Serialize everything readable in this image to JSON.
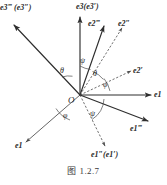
{
  "figure": {
    "caption": "图 1.2.7",
    "origin_label": "O"
  },
  "axes": [
    {
      "id": "e3",
      "label_html": "e3(e3')",
      "base": "e",
      "sub": "3",
      "primes": "",
      "paren_base": "e",
      "paren_sub": "3",
      "paren_primes": "′",
      "style": "solid",
      "x1": 80,
      "y1": 95,
      "x2": 80,
      "y2": 17
    },
    {
      "id": "e3tp",
      "label_html": "e3'''(e3'')",
      "base": "e",
      "sub": "3",
      "primes": "‴",
      "paren_base": "e",
      "paren_sub": "3",
      "paren_primes": "″",
      "style": "solid",
      "x1": 80,
      "y1": 95,
      "x2": 13,
      "y2": 24
    },
    {
      "id": "e2tp",
      "label_html": "e2'''",
      "base": "e",
      "sub": "2",
      "primes": "‴",
      "style": "solid",
      "x1": 80,
      "y1": 95,
      "x2": 105,
      "y2": 25
    },
    {
      "id": "e2dp",
      "label_html": "e2''",
      "base": "e",
      "sub": "2",
      "primes": "″",
      "style": "dashed",
      "x1": 80,
      "y1": 95,
      "x2": 124,
      "y2": 26
    },
    {
      "id": "e2p",
      "label_html": "e2'",
      "base": "e",
      "sub": "2",
      "primes": "′",
      "style": "dashed",
      "x1": 80,
      "y1": 95,
      "x2": 133,
      "y2": 70
    },
    {
      "id": "e1",
      "label_html": "e1",
      "base": "e",
      "sub": "1",
      "primes": "",
      "style": "solid",
      "x1": 80,
      "y1": 95,
      "x2": 153,
      "y2": 95
    },
    {
      "id": "e1tp",
      "label_html": "e1'''",
      "base": "e",
      "sub": "1",
      "primes": "‴",
      "style": "solid",
      "x1": 80,
      "y1": 95,
      "x2": 150,
      "y2": 122
    },
    {
      "id": "e1dp",
      "label_html": "e1''(e1')",
      "base": "e",
      "sub": "1",
      "primes": "″",
      "paren_base": "e",
      "paren_sub": "1",
      "paren_primes": "′",
      "style": "dashed",
      "x1": 80,
      "y1": 95,
      "x2": 106,
      "y2": 148
    },
    {
      "id": "e1base",
      "label_html": "e1",
      "base": "e",
      "sub": "1",
      "primes": "",
      "style": "thin",
      "x1": 80,
      "y1": 95,
      "x2": 25,
      "y2": 143
    }
  ],
  "angles": [
    {
      "id": "theta-upper-left",
      "symbol": "θ",
      "x": 62,
      "y": 72
    },
    {
      "id": "psi-upper",
      "symbol": "ψ",
      "x": 82,
      "y": 62
    },
    {
      "id": "theta-upper-right",
      "symbol": "θ",
      "x": 96,
      "y": 73
    },
    {
      "id": "phi-right",
      "symbol": "φ",
      "x": 104,
      "y": 84
    },
    {
      "id": "phi-lower-left",
      "symbol": "φ",
      "x": 64,
      "y": 115
    },
    {
      "id": "psi-lower-right",
      "symbol": "ψ",
      "x": 91,
      "y": 113
    }
  ],
  "labels": {
    "e3": {
      "text": "e3(e3′)"
    },
    "e3tp": {
      "text": "e3‴ (e3″)"
    },
    "e2tp": {
      "text": "e2‴"
    },
    "e2dp": {
      "text": "e2″"
    },
    "e2p": {
      "text": "e2′"
    },
    "e1": {
      "text": "e1"
    },
    "e1tp": {
      "text": "e1‴"
    },
    "e1dp": {
      "text": "e1″(e1′)"
    },
    "e1base": {
      "text": "e1"
    }
  },
  "colors": {
    "ink": "#2e2e2e",
    "thin_ink": "#4a4a4a",
    "background": "#ffffff"
  }
}
